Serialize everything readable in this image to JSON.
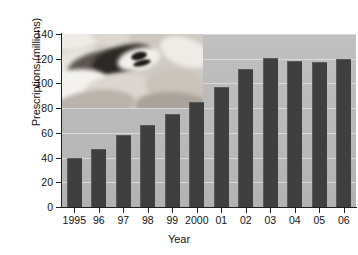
{
  "chart_data": {
    "type": "bar",
    "title": "",
    "subtitle": "",
    "xlabel": "Year",
    "ylabel": "Prescriptions (millions)",
    "categories": [
      "1995",
      "96",
      "97",
      "98",
      "99",
      "2000",
      "01",
      "02",
      "03",
      "04",
      "05",
      "06"
    ],
    "values": [
      40,
      47,
      58,
      66,
      75,
      85,
      97,
      112,
      121,
      118,
      117,
      120
    ],
    "series": [
      {
        "name": "Prescriptions",
        "values": [
          40,
          47,
          58,
          66,
          75,
          85,
          97,
          112,
          121,
          118,
          117,
          120
        ]
      }
    ],
    "ylim": [
      0,
      140
    ],
    "ytick_labels": [
      "0",
      "20",
      "40",
      "60",
      "80",
      "100",
      "120",
      "140"
    ],
    "ytick_values": [
      0,
      20,
      40,
      60,
      80,
      100,
      120,
      140
    ],
    "grid": "horizontal",
    "legend": "none",
    "annotations": [
      {
        "name": "inset-photo",
        "description": "photograph of assorted pills and capsules overlaid on upper-left of plot area"
      }
    ],
    "colors": {
      "bar_fill": "#3f3f3f",
      "bar_edge": "#5a5a5a",
      "plot_background": "#b9b9b9",
      "gridline": "#dedede",
      "axis": "#1d1d1d",
      "text": "#141414",
      "figure_background": "#ffffff"
    }
  }
}
